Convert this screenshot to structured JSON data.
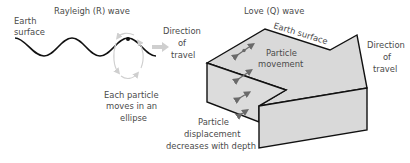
{
  "rayleigh": {
    "title": "Rayleigh (R) wave",
    "surface_label": [
      "Earth",
      "surface"
    ],
    "direction_label": [
      "Direction",
      "of",
      "travel"
    ],
    "ellipse_label": [
      "Each particle",
      "moves in an",
      "ellipse"
    ]
  },
  "love": {
    "title": "Love (Q) wave",
    "surface_label": "Earth surface",
    "movement_label": [
      "Particle",
      "movement"
    ],
    "direction_label": [
      "Direction",
      "of",
      "travel"
    ],
    "displacement_label": [
      "Particle",
      "displacement",
      "decreases with depth"
    ]
  },
  "colors": {
    "block_fill": "#d9d9d9",
    "block_stroke": "#111111",
    "wave_stroke": "#111111",
    "arrow_gray": "#c8c8c8",
    "dark_arrow": "#6a6a6a"
  }
}
